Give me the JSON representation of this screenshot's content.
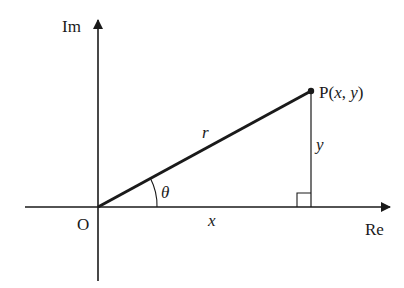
{
  "diagram": {
    "colors": {
      "line": "#1a1a1a",
      "background": "#ffffff"
    },
    "axes": {
      "imaginary": {
        "label": "Im"
      },
      "real": {
        "label": "Re"
      }
    },
    "origin": {
      "label": "O"
    },
    "point": {
      "label_prefix": "P(",
      "x": "x",
      "sep": ", ",
      "y": "y",
      "label_suffix": ")"
    },
    "segments": {
      "radius": {
        "label": "r"
      },
      "vertical": {
        "label": "y"
      },
      "horizontal": {
        "label": "x"
      }
    },
    "angle": {
      "label": "θ"
    },
    "right_angle_marker": true
  }
}
